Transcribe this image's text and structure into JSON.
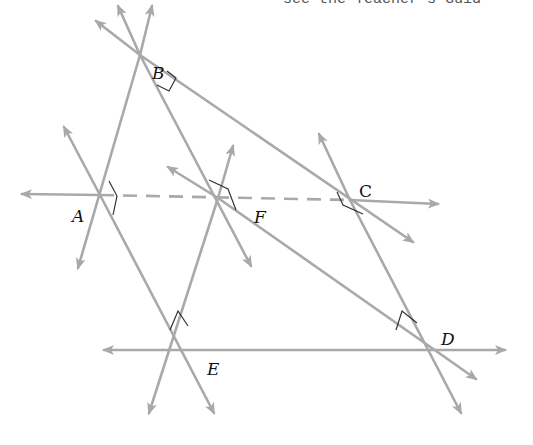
{
  "header": {
    "text": "see the Teacher's Guid"
  },
  "diagram": {
    "line_color": "#a9a9a9",
    "mark_color": "#333333",
    "points": [
      {
        "label": "B",
        "x": 140,
        "y": 55,
        "lx": 152,
        "ly": 52
      },
      {
        "label": "A",
        "x": 100,
        "y": 195,
        "lx": 72,
        "ly": 220
      },
      {
        "label": "F",
        "x": 218,
        "y": 198,
        "lx": 254,
        "ly": 218
      },
      {
        "label": "C",
        "x": 350,
        "y": 200,
        "lx": 360,
        "ly": 193
      },
      {
        "label": "D",
        "x": 430,
        "y": 350,
        "lx": 440,
        "ly": 343
      },
      {
        "label": "E",
        "x": 180,
        "y": 350,
        "lx": 207,
        "ly": 374
      }
    ]
  }
}
